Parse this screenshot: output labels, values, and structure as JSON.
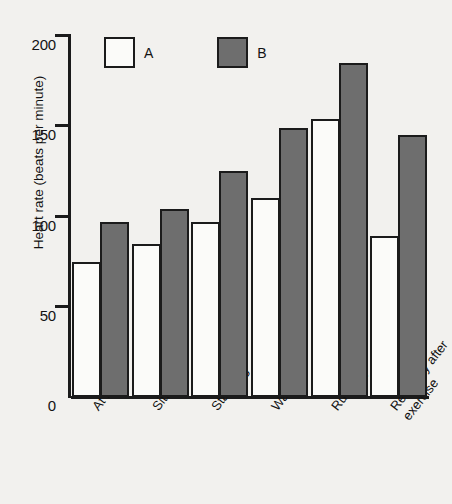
{
  "chart_data": {
    "type": "bar",
    "title": "",
    "xlabel": "",
    "ylabel": "Heart rate (beats per minute)",
    "ylim": [
      0,
      200
    ],
    "yticks": [
      0,
      50,
      100,
      150,
      200
    ],
    "ytick_labels": [
      "0",
      "50",
      "100",
      "150",
      "200"
    ],
    "grid": false,
    "legend_position": "top-left-inside",
    "categories": [
      "At rest",
      "Sitting",
      "Standing",
      "Walking",
      "Running",
      "Recovery after exercise"
    ],
    "series": [
      {
        "name": "A",
        "color": "#fbfbf9",
        "values": [
          75,
          85,
          97,
          110,
          154,
          89
        ]
      },
      {
        "name": "B",
        "color": "#6e6e6e",
        "values": [
          97,
          104,
          125,
          149,
          185,
          145
        ]
      }
    ]
  },
  "legend": {
    "items": [
      {
        "label": "A",
        "swatch": "white-square-swatch"
      },
      {
        "label": "B",
        "swatch": "grey-square-swatch"
      }
    ]
  }
}
